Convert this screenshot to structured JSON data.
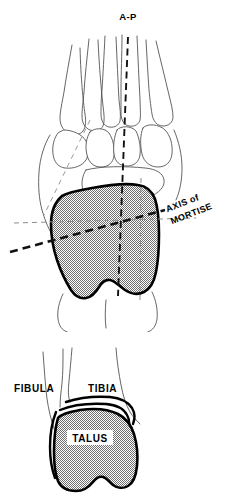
{
  "figure": {
    "panels": [
      {
        "id": "upper",
        "name": "dorsal-foot-view",
        "description": "Dorsal (top-down) view of the foot showing metatarsals, tarsal bones, talus and calcaneus with the A-P axis and axis of the mortise"
      },
      {
        "id": "lower",
        "name": "anterior-ankle-view",
        "description": "Anterior view of the ankle joint showing fibula, tibia and talus"
      }
    ]
  },
  "labels": {
    "ap": "A-P",
    "axis_line1": "AXIS of",
    "axis_line2": "MORTISE",
    "fibula": "FIBULA",
    "tibia": "TIBIA",
    "talus": "TALUS"
  },
  "colors": {
    "background": "#ffffff",
    "ink": "#000000",
    "thin_outline": "#4a4a4a",
    "stipple_gray": "#a8a8a8",
    "dashed_gray": "#8c8c8c",
    "talus_fill": "#b0b0b0"
  },
  "axes": [
    {
      "name": "a-p-axis",
      "label": "A-P",
      "style": "heavy-dashed",
      "orientation": "vertical"
    },
    {
      "name": "mortise-axis",
      "label": "AXIS of MORTISE",
      "style": "heavy-dashed",
      "orientation": "oblique",
      "approx_angle_deg": -20
    },
    {
      "name": "transverse-reference-axis",
      "label": "",
      "style": "thin-dashed",
      "orientation": "horizontal"
    },
    {
      "name": "lateral-reference-axis",
      "label": "",
      "style": "thin-dashed",
      "orientation": "oblique"
    }
  ]
}
